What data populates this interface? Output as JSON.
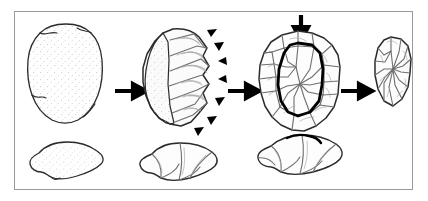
{
  "figure": {
    "frame": {
      "border_color": "#9a9a9a",
      "background_color": "#ffffff"
    },
    "colors": {
      "outline": "#2b2b2b",
      "bold_outline": "#000000",
      "scar_line": "#6f6f6f",
      "ripple_line": "#9b9b9b",
      "stipple": "#c9c9c9",
      "cortex_fill": "#fbfbfb",
      "arrow": "#000000",
      "frame": "#9a9a9a"
    }
  },
  "stages": [
    {
      "id": "stage-1",
      "name": "unworked-cobble",
      "label": "Unworked cobble",
      "plan_view_label": "Plan view, cortical nodule",
      "profile_view_label": "Profile view, cortical nodule",
      "has_profile": true,
      "has_stipple": true,
      "strike_markers": 0,
      "platform_arrow": false
    },
    {
      "id": "stage-2",
      "name": "partially-flaked-core",
      "label": "Partially flaked core",
      "plan_view_label": "Plan view, peripheral flaking begun",
      "profile_view_label": "Profile view, partially flaked core",
      "has_profile": true,
      "has_stipple": true,
      "strike_markers": 7,
      "platform_arrow": false
    },
    {
      "id": "stage-3",
      "name": "prepared-levallois-core",
      "label": "Prepared Levallois core",
      "plan_view_label": "Plan view, prepared core with outlined preform",
      "profile_view_label": "Profile view, prepared core",
      "has_profile": true,
      "has_stipple": false,
      "strike_markers": 0,
      "platform_arrow": true,
      "bold_outline_label": "Intended flake outline"
    },
    {
      "id": "stage-4",
      "name": "detached-levallois-flake",
      "label": "Detached Levallois flake",
      "plan_view_label": "Plan view, detached flake",
      "profile_view_label": "",
      "has_profile": false,
      "has_stipple": false,
      "strike_markers": 0,
      "platform_arrow": false
    }
  ],
  "arrows": [
    {
      "id": "arrow-1",
      "name": "sequence-arrow-1",
      "label": "Proceeds to stage 2",
      "direction": "right"
    },
    {
      "id": "arrow-2",
      "name": "sequence-arrow-2",
      "label": "Proceeds to stage 3",
      "direction": "right"
    },
    {
      "id": "arrow-3",
      "name": "sequence-arrow-3",
      "label": "Proceeds to stage 4",
      "direction": "right"
    }
  ],
  "platform_arrow": {
    "id": "platform-strike-arrow",
    "name": "platform-strike-arrow",
    "label": "Striking platform blow",
    "direction": "down"
  },
  "strike_markers": {
    "label": "Peripheral preparation blow",
    "glyph": "solid-triangle",
    "count": 7
  }
}
